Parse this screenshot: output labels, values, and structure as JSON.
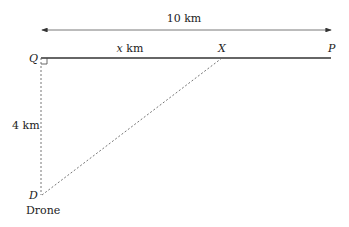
{
  "diagram": {
    "distance_label": "10 km",
    "segment_label_var": "x",
    "segment_label_unit": " km",
    "vertical_label": "4 km",
    "points": {
      "Q": "Q",
      "X": "X",
      "P": "P",
      "D": "D"
    },
    "drone_label": "Drone",
    "right_angle_at": "Q",
    "colors": {
      "line": "#333333",
      "dashed": "#666666",
      "text": "#222222"
    }
  }
}
